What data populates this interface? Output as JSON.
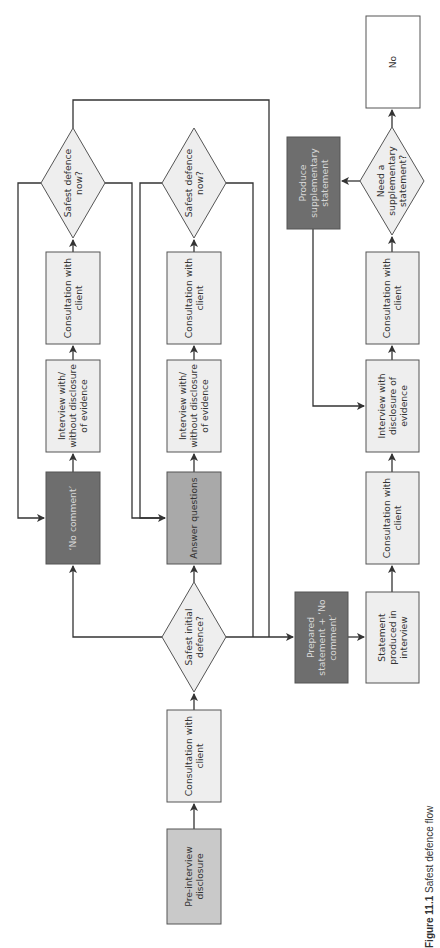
{
  "figure": {
    "caption_label": "Figure 11.1",
    "caption_text": "Safest defence flow"
  },
  "colors": {
    "light_box": "#eeeeee",
    "medium_box": "#a9a9a9",
    "mid_dark_box": "#c9c9c9",
    "dark_box": "#6e6e6e",
    "stroke": "#333333",
    "text_dark": "#333333",
    "text_on_dark": "#d8d8d8"
  },
  "nodes": [
    {
      "id": "pre-interview-disclosure",
      "type": "box",
      "x": 167,
      "y": 829,
      "w": 54,
      "h": 95,
      "fill": "mid_dark_box",
      "lines": [
        "Pre-interview",
        "disclosure"
      ]
    },
    {
      "id": "consultation-initial",
      "type": "box",
      "x": 167,
      "y": 710,
      "w": 54,
      "h": 92,
      "fill": "light_box",
      "lines": [
        "Consultation with",
        "client"
      ]
    },
    {
      "id": "safest-initial-defence",
      "type": "diamond",
      "cx": 194,
      "cy": 637,
      "rx": 32,
      "ry": 55,
      "lines": [
        "Safest initial",
        "defence?"
      ]
    },
    {
      "id": "no-comment",
      "type": "box",
      "x": 46,
      "y": 472,
      "w": 54,
      "h": 92,
      "fill": "dark_box",
      "lines": [
        "‘No comment’"
      ]
    },
    {
      "id": "interview-nc",
      "type": "box",
      "x": 46,
      "y": 360,
      "w": 54,
      "h": 92,
      "fill": "light_box",
      "lines": [
        "Interview with/",
        "without disclosure",
        "of evidence"
      ]
    },
    {
      "id": "consultation-nc",
      "type": "box",
      "x": 46,
      "y": 252,
      "w": 54,
      "h": 92,
      "fill": "light_box",
      "lines": [
        "Consultation with",
        "client"
      ]
    },
    {
      "id": "safest-now-nc",
      "type": "diamond",
      "cx": 73,
      "cy": 183,
      "rx": 32,
      "ry": 55,
      "lines": [
        "Safest defence",
        "now?"
      ]
    },
    {
      "id": "answer-questions",
      "type": "box",
      "x": 167,
      "y": 472,
      "w": 54,
      "h": 92,
      "fill": "medium_box",
      "lines": [
        "Answer questions"
      ]
    },
    {
      "id": "interview-aq",
      "type": "box",
      "x": 167,
      "y": 360,
      "w": 54,
      "h": 92,
      "fill": "light_box",
      "lines": [
        "Interview with/",
        "without disclosure",
        "of evidence"
      ]
    },
    {
      "id": "consultation-aq",
      "type": "box",
      "x": 167,
      "y": 252,
      "w": 54,
      "h": 92,
      "fill": "light_box",
      "lines": [
        "Consultation with",
        "client"
      ]
    },
    {
      "id": "safest-now-aq",
      "type": "diamond",
      "cx": 194,
      "cy": 183,
      "rx": 32,
      "ry": 55,
      "lines": [
        "Safest defence",
        "now?"
      ]
    },
    {
      "id": "prepared-statement",
      "type": "box",
      "x": 295,
      "y": 592,
      "w": 53,
      "h": 91,
      "fill": "dark_box",
      "lines": [
        "Prepared",
        "statement + ‘No",
        "comment’"
      ]
    },
    {
      "id": "statement-produced",
      "type": "box",
      "x": 366,
      "y": 592,
      "w": 53,
      "h": 91,
      "fill": "light_box",
      "lines": [
        "Statement",
        "produced in",
        "interview"
      ]
    },
    {
      "id": "consultation-ps",
      "type": "box",
      "x": 366,
      "y": 472,
      "w": 53,
      "h": 92,
      "fill": "light_box",
      "lines": [
        "Consultation with",
        "client"
      ]
    },
    {
      "id": "interview-disclosure",
      "type": "box",
      "x": 366,
      "y": 360,
      "w": 53,
      "h": 92,
      "fill": "light_box",
      "lines": [
        "Interview with",
        "disclosure of",
        "evidence"
      ]
    },
    {
      "id": "consultation-ps2",
      "type": "box",
      "x": 366,
      "y": 252,
      "w": 53,
      "h": 92,
      "fill": "light_box",
      "lines": [
        "Consultation with",
        "client"
      ]
    },
    {
      "id": "need-supplementary",
      "type": "diamond",
      "cx": 392,
      "cy": 181,
      "rx": 32,
      "ry": 54,
      "lines": [
        "Need a",
        "supplementary",
        "statement?"
      ]
    },
    {
      "id": "produce-supplementary",
      "type": "box",
      "x": 287,
      "y": 137,
      "w": 53,
      "h": 92,
      "fill": "dark_box",
      "lines": [
        "Produce",
        "supplementary",
        "statement"
      ]
    },
    {
      "id": "no-box",
      "type": "box",
      "x": 366,
      "y": 16,
      "w": 54,
      "h": 92,
      "fill": "white",
      "lines": [
        "No"
      ]
    }
  ],
  "edges": [
    {
      "from": "pre-interview-disclosure",
      "to": "consultation-initial",
      "points": [
        [
          194,
          829
        ],
        [
          194,
          804
        ]
      ],
      "arrow": true
    },
    {
      "from": "consultation-initial",
      "to": "safest-initial-defence",
      "points": [
        [
          194,
          710
        ],
        [
          194,
          694
        ]
      ],
      "arrow": true
    },
    {
      "from": "safest-initial-defence",
      "to": "no-comment",
      "points": [
        [
          162,
          637
        ],
        [
          73,
          637
        ],
        [
          73,
          566
        ]
      ],
      "arrow": true
    },
    {
      "from": "safest-initial-defence",
      "to": "answer-questions",
      "points": [
        [
          194,
          582
        ],
        [
          194,
          566
        ]
      ],
      "arrow": true
    },
    {
      "from": "safest-initial-defence",
      "to": "prepared-statement",
      "points": [
        [
          226,
          637
        ],
        [
          293,
          637
        ]
      ],
      "arrow": true
    },
    {
      "from": "no-comment",
      "to": "interview-nc",
      "points": [
        [
          73,
          472
        ],
        [
          73,
          454
        ]
      ],
      "arrow": true
    },
    {
      "from": "interview-nc",
      "to": "consultation-nc",
      "points": [
        [
          73,
          360
        ],
        [
          73,
          346
        ]
      ],
      "arrow": true
    },
    {
      "from": "consultation-nc",
      "to": "safest-now-nc",
      "points": [
        [
          73,
          252
        ],
        [
          73,
          240
        ]
      ],
      "arrow": true
    },
    {
      "from": "safest-now-nc",
      "to": "no-comment",
      "points": [
        [
          41,
          183
        ],
        [
          18,
          183
        ],
        [
          18,
          518
        ],
        [
          44,
          518
        ]
      ],
      "arrow": true
    },
    {
      "from": "safest-now-nc",
      "to": "answer-questions",
      "points": [
        [
          105,
          183
        ],
        [
          132,
          183
        ],
        [
          132,
          518
        ],
        [
          165,
          518
        ]
      ],
      "arrow": true
    },
    {
      "from": "safest-now-nc",
      "to": "prepared-statement",
      "points": [
        [
          73,
          128
        ],
        [
          73,
          100
        ],
        [
          269,
          100
        ],
        [
          269,
          637
        ]
      ],
      "arrow": false
    },
    {
      "from": "answer-questions",
      "to": "interview-aq",
      "points": [
        [
          194,
          472
        ],
        [
          194,
          454
        ]
      ],
      "arrow": true
    },
    {
      "from": "interview-aq",
      "to": "consultation-aq",
      "points": [
        [
          194,
          360
        ],
        [
          194,
          346
        ]
      ],
      "arrow": true
    },
    {
      "from": "consultation-aq",
      "to": "safest-now-aq",
      "points": [
        [
          194,
          252
        ],
        [
          194,
          240
        ]
      ],
      "arrow": true
    },
    {
      "from": "safest-now-aq",
      "to": "answer-questions",
      "points": [
        [
          162,
          183
        ],
        [
          140,
          183
        ],
        [
          140,
          518
        ],
        [
          165,
          518
        ]
      ],
      "arrow": false
    },
    {
      "from": "safest-now-aq",
      "to": "prepared-statement",
      "points": [
        [
          226,
          183
        ],
        [
          253,
          183
        ],
        [
          253,
          637
        ]
      ],
      "arrow": false
    },
    {
      "from": "prepared-statement",
      "to": "statement-produced",
      "points": [
        [
          348,
          637
        ],
        [
          364,
          637
        ]
      ],
      "arrow": true
    },
    {
      "from": "statement-produced",
      "to": "consultation-ps",
      "points": [
        [
          392,
          592
        ],
        [
          392,
          566
        ]
      ],
      "arrow": true
    },
    {
      "from": "consultation-ps",
      "to": "interview-disclosure",
      "points": [
        [
          392,
          472
        ],
        [
          392,
          454
        ]
      ],
      "arrow": true
    },
    {
      "from": "interview-disclosure",
      "to": "consultation-ps2",
      "points": [
        [
          392,
          360
        ],
        [
          392,
          346
        ]
      ],
      "arrow": true
    },
    {
      "from": "consultation-ps2",
      "to": "need-supplementary",
      "points": [
        [
          392,
          252
        ],
        [
          392,
          237
        ]
      ],
      "arrow": true
    },
    {
      "from": "need-supplementary",
      "to": "produce-supplementary",
      "points": [
        [
          360,
          181
        ],
        [
          342,
          181
        ]
      ],
      "arrow": true
    },
    {
      "from": "need-supplementary",
      "to": "no-box",
      "points": [
        [
          392,
          127
        ],
        [
          392,
          110
        ]
      ],
      "arrow": true
    },
    {
      "from": "produce-supplementary",
      "to": "interview-disclosure",
      "points": [
        [
          313,
          229
        ],
        [
          313,
          406
        ],
        [
          364,
          406
        ]
      ],
      "arrow": true
    }
  ]
}
